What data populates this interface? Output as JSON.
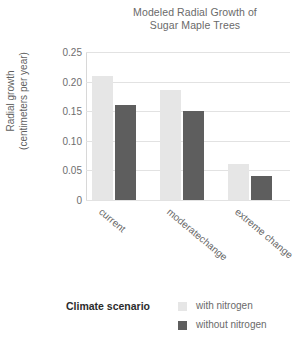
{
  "chart_data": {
    "type": "bar",
    "title": "Modeled Radial Growth of Sugar Maple Trees",
    "title_lines": [
      "Modeled Radial Growth of",
      "Sugar Maple Trees"
    ],
    "xlabel": "Climate scenario",
    "ylabel": "Radial growth (centimeters per year)",
    "ylabel_lines": [
      "Radial growth",
      "(centimeters per year)"
    ],
    "categories": [
      "current",
      "moderatechange",
      "extreme change"
    ],
    "series": [
      {
        "name": "with nitrogen",
        "color": "#e6e6e6",
        "values": [
          0.21,
          0.185,
          0.06
        ]
      },
      {
        "name": "without nitrogen",
        "color": "#5e5e5e",
        "values": [
          0.16,
          0.15,
          0.04
        ]
      }
    ],
    "ylim": [
      0,
      0.25
    ],
    "yticks": [
      0,
      0.05,
      0.1,
      0.15,
      0.2,
      0.25
    ],
    "ytick_labels": [
      "0",
      "0.05",
      "0.10",
      "0.15",
      "0.20",
      "0.25"
    ],
    "grid": true,
    "legend_position": "bottom-right",
    "legend_title": "Climate scenario"
  }
}
